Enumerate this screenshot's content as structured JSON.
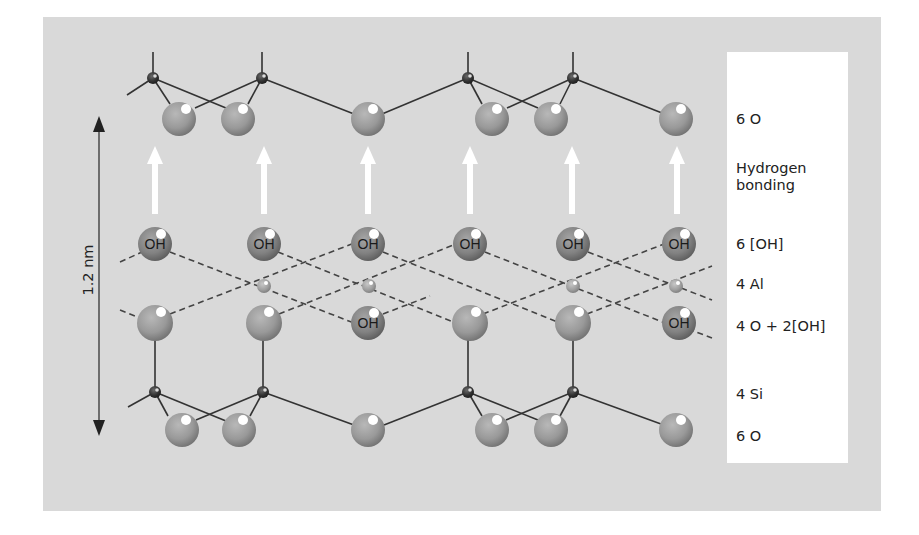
{
  "diagram": {
    "scale_bar": {
      "label": "1.2 nm"
    },
    "layers": [
      {
        "id": "top-oxygen",
        "label": "6 O"
      },
      {
        "id": "hydrogen-bonding",
        "label_line1": "Hydrogen",
        "label_line2": "bonding"
      },
      {
        "id": "hydroxyl",
        "label": "6 [OH]"
      },
      {
        "id": "aluminium",
        "label": "4 Al"
      },
      {
        "id": "mixed-oxygen-hydroxyl",
        "label": "4 O + 2[OH]"
      },
      {
        "id": "silicon",
        "label": "4 Si"
      },
      {
        "id": "bottom-oxygen",
        "label": "6 O"
      }
    ],
    "atom_text": {
      "hydroxyl": "OH"
    },
    "colors": {
      "background": "#d9d9d9",
      "label_panel": "#ffffff",
      "oxygen": "#9a9a9a",
      "hydroxyl": "#808080",
      "silicon": "#2e2e2e",
      "aluminium": "#a8a8a8",
      "bond": "#333333",
      "hbond_arrow": "#ffffff"
    }
  }
}
